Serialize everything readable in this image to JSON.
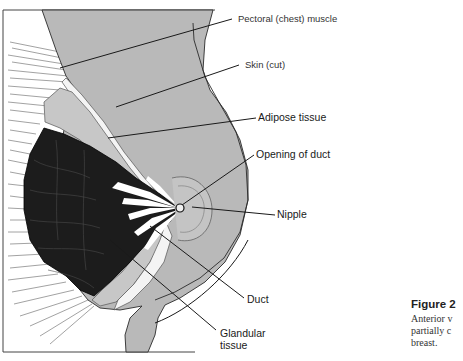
{
  "figure": {
    "type": "anatomical-diagram",
    "labels": {
      "pectoral_muscle": "Pectoral (chest) muscle",
      "skin": "Skin (cut)",
      "adipose": "Adipose tissue",
      "opening_of_duct": "Opening of duct",
      "nipple": "Nipple",
      "duct": "Duct",
      "glandular_line1": "Glandular",
      "glandular_line2": "tissue"
    },
    "caption": {
      "title": "Figure 2",
      "lines": [
        "Anterior v",
        "partially c",
        "breast."
      ]
    },
    "colors": {
      "background": "#ffffff",
      "body_gray": "#b9b9b9",
      "glandular": "#1c1c1c",
      "adipose": "#c7c7c7",
      "leader_line": "#1a1a1a"
    }
  }
}
